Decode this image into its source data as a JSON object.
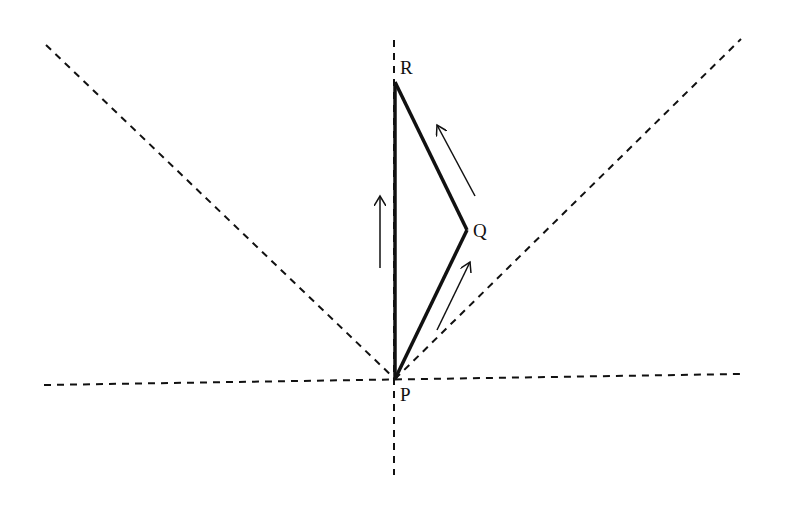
{
  "diagram": {
    "type": "path-diagram",
    "points": [
      {
        "id": "P",
        "label": "P",
        "x": 395,
        "y": 379
      },
      {
        "id": "Q",
        "label": "Q",
        "x": 467,
        "y": 230
      },
      {
        "id": "R",
        "label": "R",
        "x": 395,
        "y": 82
      }
    ],
    "solid_segments": [
      {
        "from": "P",
        "to": "R"
      },
      {
        "from": "P",
        "to": "Q"
      },
      {
        "from": "Q",
        "to": "R"
      }
    ],
    "dashed_lines": [
      {
        "name": "vertical-axis",
        "x1": 394,
        "y1": 40,
        "x2": 394,
        "y2": 475
      },
      {
        "name": "horizontal-axis",
        "x1": 44,
        "y1": 385,
        "x2": 740,
        "y2": 374
      },
      {
        "name": "left-diagonal",
        "x1": 46,
        "y1": 45,
        "x2": 395,
        "y2": 379
      },
      {
        "name": "right-diagonal",
        "x1": 395,
        "y1": 379,
        "x2": 741,
        "y2": 39
      }
    ],
    "arrows": [
      {
        "name": "arrow-up-along-PR",
        "x1": 380,
        "y1": 268,
        "x2": 380,
        "y2": 196
      },
      {
        "name": "arrow-along-PQ",
        "x1": 437,
        "y1": 330,
        "x2": 470,
        "y2": 262
      },
      {
        "name": "arrow-along-QR",
        "x1": 475,
        "y1": 196,
        "x2": 437,
        "y2": 125
      }
    ],
    "colors": {
      "line": "#111111",
      "background": "#ffffff"
    }
  }
}
